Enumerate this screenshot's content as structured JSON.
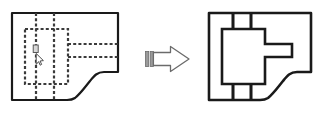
{
  "document": {
    "title": "Engineering drawing transformation",
    "background_color": "#ffffff",
    "line_color": "#1a1a1a",
    "dashed_line_color": "#3a3a3a",
    "arrow_fill_color": "#ffffff",
    "arrow_stroke_color": "#6b6b6b",
    "arrow_tail_fill_color": "#9a9a9a",
    "cursor_color": "#4a4a4a"
  },
  "panels": [
    {
      "id": "left-figure",
      "name": "source-view-with-hidden-lines",
      "label": "",
      "line_style": "solid outline with dashed hidden lines",
      "outline": {
        "points": "12,12 120,12 120,73 105,73 95,84 78,84 68,101 12,101",
        "closed": true,
        "corner_curves": true
      },
      "dashed_features": [
        {
          "name": "vertical-hidden-line-left",
          "x1": 36,
          "y1": 12,
          "x2": 36,
          "y2": 101
        },
        {
          "name": "vertical-hidden-line-right",
          "x1": 54,
          "y1": 12,
          "x2": 54,
          "y2": 101
        },
        {
          "name": "hidden-rectangle",
          "x": 25,
          "y": 29,
          "width": 43,
          "height": 55
        },
        {
          "name": "tongue-top-hidden-line",
          "x1": 68,
          "y1": 44,
          "x2": 120,
          "y2": 44
        },
        {
          "name": "tongue-bottom-hidden-line",
          "x1": 68,
          "y1": 57,
          "x2": 120,
          "y2": 57
        },
        {
          "name": "tongue-left-hidden-line",
          "x1": 68,
          "y1": 44,
          "x2": 68,
          "y2": 57
        }
      ],
      "cursor": {
        "name": "mouse-pointer",
        "x": 36,
        "y": 47
      }
    },
    {
      "id": "right-figure",
      "name": "result-view-solid-lines",
      "label": "",
      "line_style": "solid lines only",
      "outline": {
        "points": "209,12 317,12 317,73 302,73 292,84 275,84 265,101 209,101",
        "closed": true,
        "corner_curves": true
      },
      "solid_features": [
        {
          "name": "vertical-line-left",
          "x1": 233,
          "y1": 12,
          "x2": 233,
          "y2": 101
        },
        {
          "name": "vertical-line-right",
          "x1": 251,
          "y1": 12,
          "x2": 251,
          "y2": 101
        },
        {
          "name": "boss-rectangle",
          "x": 222,
          "y": 29,
          "width": 43,
          "height": 55
        },
        {
          "name": "tongue-top-line",
          "x1": 265,
          "y1": 44,
          "x2": 292,
          "y2": 44
        },
        {
          "name": "tongue-bottom-line",
          "x1": 265,
          "y1": 57,
          "x2": 292,
          "y2": 57
        },
        {
          "name": "tongue-right-line",
          "x1": 292,
          "y1": 44,
          "x2": 292,
          "y2": 57
        }
      ]
    }
  ],
  "arrow": {
    "name": "transformation-arrow",
    "direction": "right",
    "label": "",
    "body": {
      "x": 148,
      "y": 52,
      "width": 22,
      "height": 14
    },
    "head": {
      "tip_x": 190,
      "tip_y": 59,
      "top_y": 46,
      "bottom_y": 72,
      "base_x": 170
    },
    "tail_stripes": [
      {
        "x": 146,
        "width": 3
      },
      {
        "x": 151,
        "width": 3
      }
    ]
  }
}
